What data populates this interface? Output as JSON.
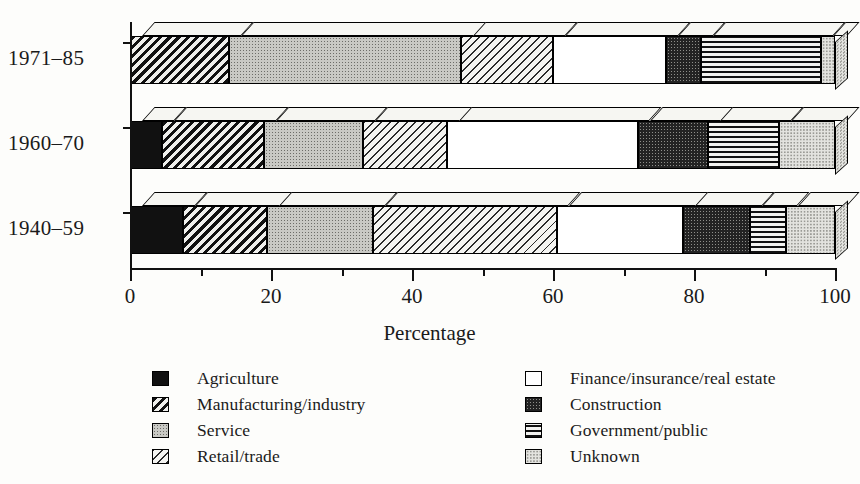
{
  "chart_data": {
    "type": "bar",
    "orientation": "horizontal",
    "stacked": true,
    "percent_stacked": true,
    "title": "",
    "xlabel": "Percentage",
    "ylabel": "",
    "xlim": [
      0,
      100
    ],
    "xticks": [
      0,
      20,
      40,
      60,
      80,
      100
    ],
    "xticklabels": [
      "0",
      "20",
      "40",
      "60",
      "80",
      "100"
    ],
    "minor_xticks": [
      10,
      30,
      50,
      70,
      90
    ],
    "grid": false,
    "legend_position": "bottom",
    "categories": [
      "1971–85",
      "1960–70",
      "1940–59"
    ],
    "series": [
      {
        "name": "Agriculture",
        "values": [
          0,
          4.5,
          7.5
        ]
      },
      {
        "name": "Manufacturing/industry",
        "values": [
          14,
          14.5,
          12
        ]
      },
      {
        "name": "Service",
        "values": [
          33,
          14,
          15
        ]
      },
      {
        "name": "Retail/trade",
        "values": [
          13,
          12,
          26
        ]
      },
      {
        "name": "Finance/insurance/real estate",
        "values": [
          16,
          27,
          18
        ]
      },
      {
        "name": "Construction",
        "values": [
          5,
          10,
          9.5
        ]
      },
      {
        "name": "Government/public",
        "values": [
          17,
          10,
          5
        ]
      },
      {
        "name": "Unknown",
        "values": [
          2,
          8,
          7
        ]
      }
    ]
  },
  "axis": {
    "title": "Percentage",
    "tick_labels": [
      "0",
      "20",
      "40",
      "60",
      "80",
      "100"
    ]
  },
  "categories": [
    {
      "label": "1971–85"
    },
    {
      "label": "1960–70"
    },
    {
      "label": "1940–59"
    }
  ],
  "legend": {
    "left_column": [
      {
        "label": "Agriculture",
        "pattern": "solid",
        "swatch_name": "swatch-agriculture"
      },
      {
        "label": "Manufacturing/industry",
        "pattern": "hatch-dark",
        "swatch_name": "swatch-manufacturing"
      },
      {
        "label": "Service",
        "pattern": "dots-mid",
        "swatch_name": "swatch-service"
      },
      {
        "label": "Retail/trade",
        "pattern": "hatch-light",
        "swatch_name": "swatch-retail"
      }
    ],
    "right_column": [
      {
        "label": "Finance/insurance/real estate",
        "pattern": "white",
        "swatch_name": "swatch-finance"
      },
      {
        "label": "Construction",
        "pattern": "dots-dark",
        "swatch_name": "swatch-construction"
      },
      {
        "label": "Government/public",
        "pattern": "lines-h",
        "swatch_name": "swatch-government"
      },
      {
        "label": "Unknown",
        "pattern": "dots-light",
        "swatch_name": "swatch-unknown"
      }
    ]
  },
  "colors": {
    "ink": "#111111",
    "paper": "#fdfdfb",
    "solid": "#111111",
    "dots_mid": "#c9c9c4",
    "dots_dark": "#232323",
    "dots_light": "#e3e3df",
    "white": "#ffffff"
  }
}
